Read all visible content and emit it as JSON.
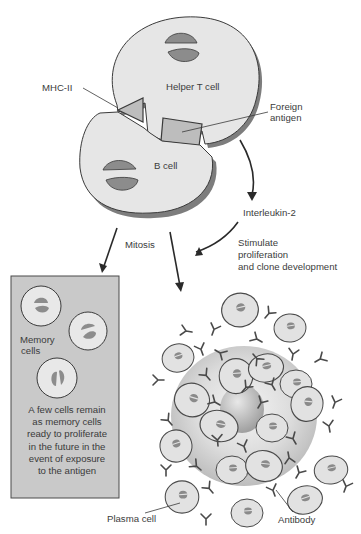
{
  "figure": {
    "labels": {
      "helper_t_cell": "Helper T cell",
      "mhc_ii": "MHC-II",
      "foreign_antigen_line1": "Foreign",
      "foreign_antigen_line2": "antigen",
      "b_cell": "B cell",
      "interleukin": "Interleukin-2",
      "mitosis": "Mitosis",
      "stimulate_line1": "Stimulate",
      "stimulate_line2": "proliferation",
      "stimulate_line3": "and clone development",
      "memory_cells_line1": "Memory",
      "memory_cells_line2": "cells",
      "memory_note_line1": "A few cells remain",
      "memory_note_line2": "as memory cells",
      "memory_note_line3": "ready to proliferate",
      "memory_note_line4": "in the future in the",
      "memory_note_line5": "event of exposure",
      "memory_note_line6": "to the antigen",
      "plasma_cell": "Plasma cell",
      "antibody": "Antibody"
    },
    "colors": {
      "cell_fill": "#e6e6e6",
      "cell_shadow": "#7d7d7d",
      "nucleus": "#8c8c8c",
      "outline": "#3a3a3a",
      "memory_box": "#c9c9c9",
      "receptor": "#bdbdbd"
    }
  }
}
